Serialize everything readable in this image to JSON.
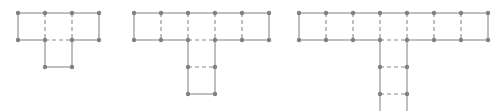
{
  "figure": {
    "background_color": "#ffffff",
    "node_color": "#808080",
    "edge_color": "#8a8a8a",
    "node_radius": 2.2,
    "edge_width": 1.1,
    "cell_size": 27,
    "dash_pattern": "4,3",
    "boundary_style": "solid",
    "interior_style": "dashed",
    "diagrams": [
      {
        "name": "diagram-1",
        "arm_cells": 3,
        "stem_cells": 1,
        "origin_x": 18,
        "origin_y": 13,
        "stem_column": 1,
        "clipped_bottom": false
      },
      {
        "name": "diagram-2",
        "arm_cells": 5,
        "stem_cells": 2,
        "origin_x": 134,
        "origin_y": 13,
        "stem_column": 2,
        "clipped_bottom": false
      },
      {
        "name": "diagram-3",
        "arm_cells": 7,
        "stem_cells": 3,
        "origin_x": 299,
        "origin_y": 13,
        "stem_column": 3,
        "clipped_bottom": true
      }
    ]
  }
}
